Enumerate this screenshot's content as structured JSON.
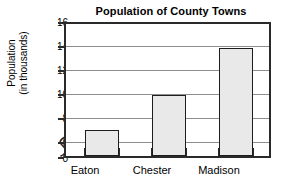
{
  "chart_data": {
    "type": "bar",
    "title": "Population of County Towns",
    "xlabel": "",
    "ylabel": "Population (in thousands)",
    "ylabel_lines": [
      "Population",
      "(in thousands)"
    ],
    "categories": [
      "Eaton",
      "Chester",
      "Madison"
    ],
    "values": [
      7,
      10,
      14
    ],
    "series": [
      {
        "name": "Population",
        "values": [
          7,
          10,
          14
        ]
      }
    ],
    "ylim": [
      0,
      16
    ],
    "y_axis_break": true,
    "y_axis_break_range": [
      0,
      6
    ],
    "ytick_labels": [
      "16",
      "14",
      "12",
      "10",
      "8",
      "6",
      "0"
    ],
    "ytick_values": [
      16,
      14,
      12,
      10,
      8,
      6,
      0
    ],
    "gridlines": [
      "14",
      "12",
      "10",
      "8",
      "6"
    ],
    "grid": true,
    "legend": null,
    "legend_position": "none",
    "annotations": [],
    "colors": {
      "bar_fill": "#e9e9e9",
      "bar_border": "#1d1d1d",
      "gridline": "#8e8e8e",
      "axis": "#2a2a2a",
      "background": "#ffffff",
      "text": "#000000"
    }
  }
}
